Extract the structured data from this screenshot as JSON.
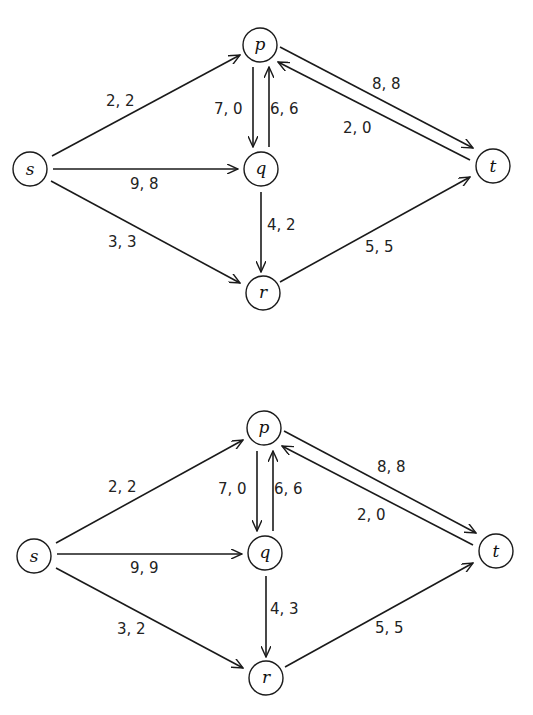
{
  "figure": {
    "colors": {
      "stroke": "#1a1a1a",
      "text": "#222222",
      "background": "#ffffff"
    },
    "networks": [
      {
        "id": "top",
        "nodes": [
          {
            "id": "s",
            "label": "s",
            "x": 30,
            "y": 169
          },
          {
            "id": "p",
            "label": "p",
            "x": 260,
            "y": 45
          },
          {
            "id": "q",
            "label": "q",
            "x": 261,
            "y": 169
          },
          {
            "id": "r",
            "label": "r",
            "x": 263,
            "y": 293
          },
          {
            "id": "t",
            "label": "t",
            "x": 493,
            "y": 166
          }
        ],
        "edges": [
          {
            "from": "s",
            "to": "p",
            "label": "2, 2",
            "capacity": 2,
            "flow": 2
          },
          {
            "from": "s",
            "to": "q",
            "label": "9, 8",
            "capacity": 9,
            "flow": 8
          },
          {
            "from": "s",
            "to": "r",
            "label": "3, 3",
            "capacity": 3,
            "flow": 3
          },
          {
            "from": "p",
            "to": "q",
            "label": "7, 0",
            "capacity": 7,
            "flow": 0
          },
          {
            "from": "q",
            "to": "p",
            "label": "6, 6",
            "capacity": 6,
            "flow": 6
          },
          {
            "from": "p",
            "to": "t",
            "label": "8, 8",
            "capacity": 8,
            "flow": 8
          },
          {
            "from": "t",
            "to": "p",
            "label": "2, 0",
            "capacity": 2,
            "flow": 0
          },
          {
            "from": "q",
            "to": "r",
            "label": "4, 2",
            "capacity": 4,
            "flow": 2
          },
          {
            "from": "r",
            "to": "t",
            "label": "5, 5",
            "capacity": 5,
            "flow": 5
          }
        ]
      },
      {
        "id": "bottom",
        "nodes": [
          {
            "id": "s",
            "label": "s",
            "x": 34,
            "y": 556
          },
          {
            "id": "p",
            "label": "p",
            "x": 264,
            "y": 428
          },
          {
            "id": "q",
            "label": "q",
            "x": 265,
            "y": 553
          },
          {
            "id": "r",
            "label": "r",
            "x": 266,
            "y": 678
          },
          {
            "id": "t",
            "label": "t",
            "x": 496,
            "y": 551
          }
        ],
        "edges": [
          {
            "from": "s",
            "to": "p",
            "label": "2, 2",
            "capacity": 2,
            "flow": 2
          },
          {
            "from": "s",
            "to": "q",
            "label": "9, 9",
            "capacity": 9,
            "flow": 9
          },
          {
            "from": "s",
            "to": "r",
            "label": "3, 2",
            "capacity": 3,
            "flow": 2
          },
          {
            "from": "p",
            "to": "q",
            "label": "7, 0",
            "capacity": 7,
            "flow": 0
          },
          {
            "from": "q",
            "to": "p",
            "label": "6, 6",
            "capacity": 6,
            "flow": 6
          },
          {
            "from": "p",
            "to": "t",
            "label": "8, 8",
            "capacity": 8,
            "flow": 8
          },
          {
            "from": "t",
            "to": "p",
            "label": "2, 0",
            "capacity": 2,
            "flow": 0
          },
          {
            "from": "q",
            "to": "r",
            "label": "4, 3",
            "capacity": 4,
            "flow": 3
          },
          {
            "from": "r",
            "to": "t",
            "label": "5, 5",
            "capacity": 5,
            "flow": 5
          }
        ]
      }
    ]
  },
  "labels": {
    "top": {
      "s": "s",
      "p": "p",
      "q": "q",
      "r": "r",
      "t": "t",
      "sp": "2, 2",
      "sq": "9, 8",
      "sr": "3, 3",
      "pq": "7, 0",
      "qp": "6, 6",
      "pt": "8, 8",
      "tp": "2, 0",
      "qr": "4, 2",
      "rt": "5, 5"
    },
    "bottom": {
      "s": "s",
      "p": "p",
      "q": "q",
      "r": "r",
      "t": "t",
      "sp": "2, 2",
      "sq": "9, 9",
      "sr": "3, 2",
      "pq": "7, 0",
      "qp": "6, 6",
      "pt": "8, 8",
      "tp": "2, 0",
      "qr": "4, 3",
      "rt": "5, 5"
    }
  }
}
